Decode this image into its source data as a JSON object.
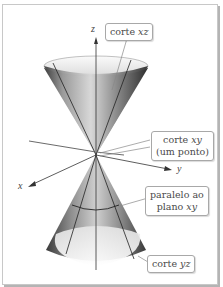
{
  "diagram": {
    "axes": {
      "x": "x",
      "y": "y",
      "z": "z"
    },
    "callouts": [
      {
        "id": "xz",
        "prefix": "corte ",
        "var": "xz",
        "suffix": ""
      },
      {
        "id": "xy",
        "line1_prefix": "corte ",
        "line1_var": "xy",
        "line2": "(um ponto)"
      },
      {
        "id": "parallel",
        "line1": "paralelo ao",
        "line2_prefix": "plano ",
        "line2_var": "xy"
      },
      {
        "id": "yz",
        "prefix": "corte ",
        "var": "yz"
      }
    ],
    "colors": {
      "frame": "#c8c8c8",
      "axis": "#333333",
      "cone_dark": "#555555",
      "cone_light": "#f2f2f2",
      "label_text": "#4a4a4a"
    }
  }
}
